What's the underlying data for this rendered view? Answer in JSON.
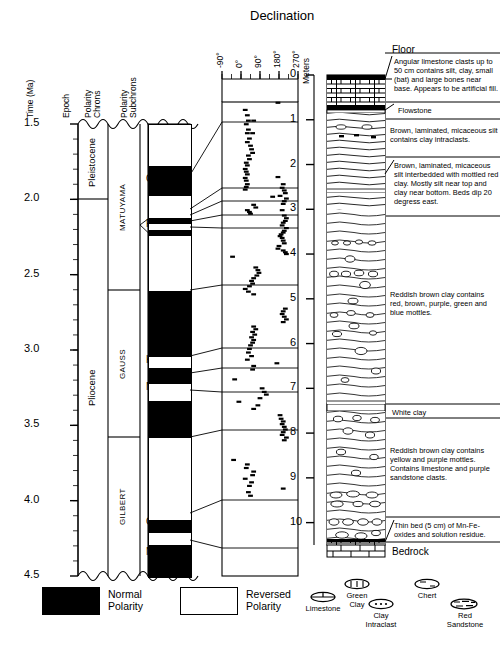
{
  "figure": {
    "declination_title": "Declination",
    "floor_label": "Floor",
    "bedrock_label": "Bedrock"
  },
  "axes": {
    "time": {
      "label": "Time (Ma)",
      "ticks": [
        "1.5",
        "2.0",
        "2.5",
        "3.0",
        "3.5",
        "4.0",
        "4.5"
      ],
      "min": 1.5,
      "max": 4.5
    },
    "declination": {
      "label": "Declination",
      "ticks": [
        "-90°",
        "0°",
        "90°",
        "180°",
        "270°"
      ],
      "min": -90,
      "max": 270
    },
    "meters": {
      "label": "Meters",
      "ticks": [
        "0",
        "1",
        "2",
        "3",
        "4",
        "5",
        "6",
        "7",
        "8",
        "9",
        "10"
      ],
      "min": 0,
      "max": 10
    }
  },
  "columns": {
    "epoch_header": "Epoch",
    "polarity_chrons_header": "Polarity\nChrons",
    "polarity_subchrons_header": "Polarity\nSubchrons"
  },
  "epochs": [
    {
      "name": "Pleistocene",
      "top_ma": 1.5,
      "base_ma": 2.0
    },
    {
      "name": "Pliocene",
      "top_ma": 2.0,
      "base_ma": 4.5
    }
  ],
  "chrons": [
    {
      "name": "MATUYAMA",
      "top_ma": 1.5,
      "base_ma": 2.6
    },
    {
      "name": "GAUSS",
      "top_ma": 2.6,
      "base_ma": 3.58
    },
    {
      "name": "GILBERT",
      "top_ma": 3.58,
      "base_ma": 4.5
    }
  ],
  "subchron_labels": [
    {
      "name": "Olduvai",
      "ma": 1.87
    },
    {
      "name": "Reunion",
      "ma": 2.17
    },
    {
      "name": "Kaena",
      "ma": 3.07
    },
    {
      "name": "Mammoth",
      "ma": 3.25
    },
    {
      "name": "Cochiti",
      "ma": 4.15
    },
    {
      "name": "Nunivak",
      "ma": 4.35
    }
  ],
  "polarity_bands": [
    {
      "top_ma": 1.5,
      "base_ma": 1.77,
      "polarity": "reversed"
    },
    {
      "top_ma": 1.77,
      "base_ma": 1.97,
      "polarity": "normal"
    },
    {
      "top_ma": 1.97,
      "base_ma": 2.12,
      "polarity": "reversed"
    },
    {
      "top_ma": 2.12,
      "base_ma": 2.16,
      "polarity": "normal"
    },
    {
      "top_ma": 2.16,
      "base_ma": 2.2,
      "polarity": "reversed"
    },
    {
      "top_ma": 2.2,
      "base_ma": 2.24,
      "polarity": "normal"
    },
    {
      "top_ma": 2.24,
      "base_ma": 2.6,
      "polarity": "reversed"
    },
    {
      "top_ma": 2.6,
      "base_ma": 3.04,
      "polarity": "normal"
    },
    {
      "top_ma": 3.04,
      "base_ma": 3.11,
      "polarity": "reversed"
    },
    {
      "top_ma": 3.11,
      "base_ma": 3.22,
      "polarity": "normal"
    },
    {
      "top_ma": 3.22,
      "base_ma": 3.33,
      "polarity": "reversed"
    },
    {
      "top_ma": 3.33,
      "base_ma": 3.58,
      "polarity": "normal"
    },
    {
      "top_ma": 3.58,
      "base_ma": 4.12,
      "polarity": "reversed"
    },
    {
      "top_ma": 4.12,
      "base_ma": 4.21,
      "polarity": "normal"
    },
    {
      "top_ma": 4.21,
      "base_ma": 4.29,
      "polarity": "reversed"
    },
    {
      "top_ma": 4.29,
      "base_ma": 4.5,
      "polarity": "normal"
    }
  ],
  "annotations": [
    {
      "id": "fill",
      "text": "Angular limestone clasts up to 50 cm contains silt, clay, small (bat) and large bones near base. Appears to be artificial fill.",
      "leader": true
    },
    {
      "id": "flowstone",
      "text": "Flowstone",
      "leader": true
    },
    {
      "id": "silt",
      "text": "Brown, laminated, micaceous silt contains clay intraclasts.",
      "leader": false
    },
    {
      "id": "silt-clay",
      "text": "Brown, laminated, micaceous silt interbedded with mottled red clay. Mostly silt near top and clay near bottom.  Beds dip 20 degress east.",
      "leader": true
    },
    {
      "id": "red-clay",
      "text": "Reddish brown clay contains red, brown, purple, green and blue mottles.",
      "leader": false
    },
    {
      "id": "white-clay",
      "text": "White clay",
      "leader": false
    },
    {
      "id": "lower-clay",
      "text": "Reddish brown clay contains yellow and purple mottles.  Contains limestone and purple sandstone clasts.",
      "leader": false
    },
    {
      "id": "mn-fe",
      "text": "Thin bed (5 cm) of Mn-Fe-oxides and solution residue.",
      "leader": true
    }
  ],
  "legend_polarity": [
    {
      "label": "Normal\nPolarity",
      "fill": "#000000"
    },
    {
      "label": "Reversed\nPolarity",
      "fill": "#ffffff"
    }
  ],
  "legend_lithology": [
    {
      "label": "Limestone",
      "symbol": "limestone-symbol"
    },
    {
      "label": "Green\nClay",
      "symbol": "green-clay-symbol"
    },
    {
      "label": "Clay\nIntraclast",
      "symbol": "clay-intraclast-symbol"
    },
    {
      "label": "Chert",
      "symbol": "chert-symbol"
    },
    {
      "label": "Red\nSandstone",
      "symbol": "red-sandstone-symbol"
    }
  ],
  "chart_data": {
    "type": "scatter",
    "title": "Declination",
    "xlabel": "Declination",
    "ylabel": "Meters",
    "xlim": [
      -90,
      270
    ],
    "ylim": [
      0,
      10.5
    ],
    "grid": false,
    "x": [
      175,
      20,
      30,
      35,
      25,
      60,
      35,
      30,
      55,
      40,
      30,
      45,
      50,
      55,
      35,
      40,
      25,
      30,
      20,
      25,
      30,
      20,
      25,
      175,
      30,
      25,
      20,
      200,
      195,
      205,
      210,
      185,
      150,
      215,
      205,
      200,
      60,
      70,
      30,
      40,
      45,
      195,
      205,
      215,
      210,
      200,
      195,
      215,
      205,
      200,
      190,
      185,
      195,
      200,
      205,
      180,
      175,
      200,
      210,
      215,
      -40,
      70,
      80,
      85,
      75,
      60,
      50,
      55,
      40,
      20,
      35,
      60,
      210,
      200,
      195,
      205,
      215,
      200,
      60,
      70,
      55,
      65,
      50,
      60,
      55,
      45,
      40,
      35,
      50,
      30,
      170,
      60,
      55,
      -30,
      100,
      110,
      120,
      90,
      -10,
      80,
      60,
      185,
      190,
      200,
      195,
      205,
      210,
      200,
      195,
      215,
      205,
      -35,
      30,
      25,
      60,
      55,
      20,
      50,
      40,
      200,
      35,
      45
    ],
    "y": [
      0.62,
      0.78,
      0.9,
      1.02,
      1.1,
      1.02,
      1.22,
      1.3,
      1.3,
      1.42,
      1.5,
      1.58,
      1.66,
      1.74,
      1.8,
      1.88,
      1.96,
      2.02,
      2.1,
      2.16,
      2.22,
      2.3,
      2.36,
      2.28,
      2.44,
      2.5,
      2.56,
      2.44,
      2.52,
      2.58,
      2.64,
      2.7,
      2.72,
      2.76,
      2.82,
      2.88,
      2.9,
      2.96,
      3.02,
      3.06,
      3.1,
      3.02,
      3.14,
      3.2,
      3.26,
      3.3,
      3.36,
      3.42,
      3.48,
      3.52,
      3.56,
      3.6,
      3.64,
      3.7,
      3.76,
      3.82,
      3.88,
      3.92,
      3.96,
      4.0,
      4.06,
      4.3,
      4.36,
      4.42,
      4.48,
      4.54,
      4.6,
      4.66,
      4.72,
      4.78,
      4.84,
      4.9,
      5.22,
      5.28,
      5.34,
      5.4,
      5.46,
      5.52,
      5.62,
      5.68,
      5.74,
      5.8,
      5.86,
      5.92,
      5.98,
      6.04,
      6.12,
      6.2,
      6.28,
      6.36,
      6.44,
      6.5,
      6.58,
      6.8,
      7.0,
      7.08,
      7.14,
      7.22,
      7.3,
      7.38,
      7.46,
      7.6,
      7.68,
      7.74,
      7.8,
      7.86,
      7.92,
      7.98,
      8.04,
      8.1,
      8.16,
      8.6,
      8.7,
      8.78,
      8.86,
      8.94,
      9.02,
      9.1,
      9.18,
      9.24,
      9.32,
      9.4
    ],
    "series": [
      {
        "name": "declination",
        "marker": "horizontal-dash"
      }
    ]
  }
}
